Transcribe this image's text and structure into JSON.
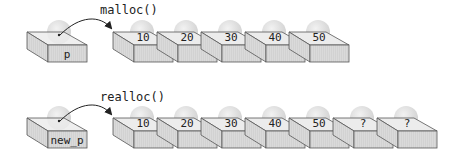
{
  "rows": [
    {
      "name": "malloc",
      "call_label": "malloc()",
      "pointer_label": "p",
      "values": [
        "10",
        "20",
        "30",
        "40",
        "50"
      ]
    },
    {
      "name": "realloc",
      "call_label": "realloc()",
      "pointer_label": "new_p",
      "values": [
        "10",
        "20",
        "30",
        "40",
        "50",
        "?",
        "?"
      ]
    }
  ],
  "colors": {
    "box_face": "#d9d9d9",
    "box_top": "#ececec",
    "box_stroke": "#555555",
    "ball": "#dcdcdc",
    "arrow": "#222222"
  }
}
